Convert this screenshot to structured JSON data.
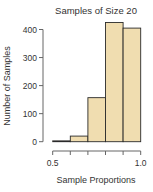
{
  "chart_data": {
    "type": "bar",
    "title": "Samples of Size 20",
    "xlabel": "Sample Proportions",
    "ylabel": "Number of Samples",
    "bins": [
      [
        0.5,
        0.6
      ],
      [
        0.6,
        0.7
      ],
      [
        0.7,
        0.8
      ],
      [
        0.8,
        0.9
      ],
      [
        0.9,
        1.0
      ]
    ],
    "categories": [
      "0.5-0.6",
      "0.6-0.7",
      "0.7-0.8",
      "0.8-0.9",
      "0.9-1.0"
    ],
    "values": [
      3,
      20,
      157,
      425,
      405
    ],
    "xlim": [
      0.5,
      1.0
    ],
    "ylim": [
      0,
      400
    ],
    "yticks": [
      0,
      100,
      200,
      300,
      400
    ],
    "ytick_labels": [
      "0",
      "100",
      "200",
      "300",
      "400"
    ],
    "xticks": [
      0.5,
      0.6,
      0.7,
      0.8,
      0.9,
      1.0
    ],
    "xtick_labels": [
      "0.5",
      "",
      "",
      "",
      "",
      "1.0"
    ],
    "grid": false,
    "legend": null,
    "colors": {
      "bar_fill": "#f0ddb0",
      "bar_edge": "#2a2a2a",
      "axis": "#666666"
    }
  }
}
